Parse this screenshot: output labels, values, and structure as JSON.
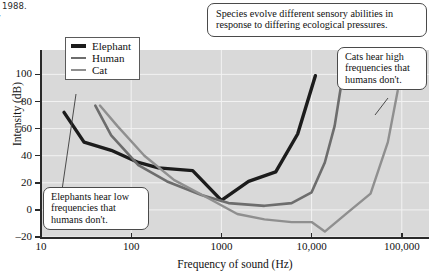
{
  "citation": {
    "text": "ay, 1988.\nFay\nd"
  },
  "legend": {
    "items": [
      {
        "label": "Elephant",
        "color": "#1c1c1c",
        "width": 3.4
      },
      {
        "label": "Human",
        "color": "#6d6d6d",
        "width": 2.6
      },
      {
        "label": "Cat",
        "color": "#8f8f8f",
        "width": 2.4
      }
    ]
  },
  "callouts": [
    {
      "id": "species",
      "text": "Species evolve different sensory abilities in response to differing ecological pressures."
    },
    {
      "id": "cats",
      "text": "Cats hear high frequencies that humans don't."
    },
    {
      "id": "elephants",
      "text": "Elephants hear low frequencies that humans don't."
    }
  ],
  "chart_data": {
    "type": "line",
    "title": "",
    "xlabel": "Frequency of sound (Hz)",
    "ylabel": "Intensity (dB)",
    "x_scale": "log",
    "xlim": [
      10,
      200000
    ],
    "ylim": [
      -20,
      118
    ],
    "xticks": [
      10,
      100,
      1000,
      10000,
      100000
    ],
    "xtick_labels": [
      "10",
      "100",
      "1000",
      "10,000",
      "100,000"
    ],
    "yticks": [
      -20,
      0,
      20,
      40,
      60,
      80,
      100
    ],
    "ytick_labels": [
      "–20",
      "0",
      "20",
      "40",
      "60",
      "80",
      "100"
    ],
    "grid": true,
    "legend_position": "top-left",
    "plot_background": "#d9d9d9",
    "series": [
      {
        "name": "Elephant",
        "color": "#1c1c1c",
        "width": 3.4,
        "points": [
          [
            18,
            72
          ],
          [
            30,
            50
          ],
          [
            60,
            44
          ],
          [
            120,
            35
          ],
          [
            200,
            31
          ],
          [
            480,
            29
          ],
          [
            1000,
            7
          ],
          [
            2000,
            21
          ],
          [
            4000,
            28
          ],
          [
            7000,
            56
          ],
          [
            11000,
            99
          ]
        ]
      },
      {
        "name": "Human",
        "color": "#6d6d6d",
        "width": 2.6,
        "points": [
          [
            40,
            77
          ],
          [
            60,
            55
          ],
          [
            120,
            33
          ],
          [
            250,
            21
          ],
          [
            600,
            11
          ],
          [
            1200,
            5
          ],
          [
            3000,
            3
          ],
          [
            6000,
            5
          ],
          [
            10000,
            13
          ],
          [
            14000,
            35
          ],
          [
            18000,
            62
          ],
          [
            21000,
            90
          ]
        ]
      },
      {
        "name": "Cat",
        "color": "#8f8f8f",
        "width": 2.4,
        "points": [
          [
            45,
            77
          ],
          [
            70,
            62
          ],
          [
            140,
            40
          ],
          [
            300,
            22
          ],
          [
            700,
            9
          ],
          [
            1500,
            -3
          ],
          [
            3000,
            -7
          ],
          [
            6000,
            -9
          ],
          [
            10000,
            -9
          ],
          [
            14000,
            -16
          ],
          [
            25000,
            -2
          ],
          [
            45000,
            12
          ],
          [
            70000,
            50
          ],
          [
            90000,
            88
          ]
        ]
      }
    ]
  }
}
